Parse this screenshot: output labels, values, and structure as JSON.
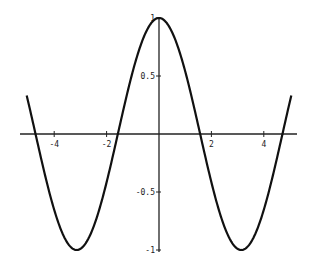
{
  "chart_data": {
    "type": "line",
    "title": "",
    "xlabel": "",
    "ylabel": "",
    "function": "cos(x)",
    "xlim": [
      -5.1,
      5.1
    ],
    "ylim": [
      -1,
      1
    ],
    "grid": false,
    "legend": null,
    "x_ticks": [
      -4,
      -2,
      2,
      4
    ],
    "x_tick_labels": [
      "-4",
      "-2",
      "2",
      "4"
    ],
    "y_ticks": [
      1,
      0.5,
      -0.5,
      -1
    ],
    "y_tick_labels": [
      "1",
      "0.5",
      "-0.5",
      "-1"
    ],
    "series": [
      {
        "name": "cos(x)",
        "x": [
          -5.05,
          -4.5,
          -4.0,
          -3.5,
          -3.14,
          -3.0,
          -2.5,
          -2.0,
          -1.57,
          -1.0,
          -0.5,
          0,
          0.5,
          1.0,
          1.57,
          2.0,
          2.5,
          3.0,
          3.14,
          3.5,
          4.0,
          4.5,
          5.05
        ],
        "values": [
          0.33,
          -0.21,
          -0.65,
          -0.94,
          -1.0,
          -0.99,
          -0.8,
          -0.42,
          0.0,
          0.54,
          0.88,
          1.0,
          0.88,
          0.54,
          0.0,
          -0.42,
          -0.8,
          -0.99,
          -1.0,
          -0.94,
          -0.65,
          -0.21,
          0.33
        ]
      }
    ]
  }
}
